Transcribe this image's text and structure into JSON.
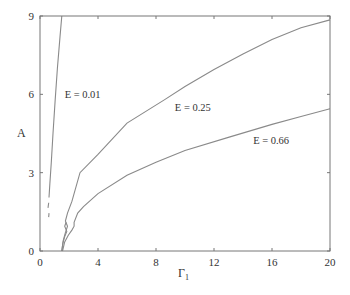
{
  "chart_data": {
    "type": "line",
    "title": "",
    "xlabel": "Γ",
    "xlabel_sub": "1",
    "ylabel": "A",
    "xlim": [
      0,
      20
    ],
    "ylim": [
      0,
      9
    ],
    "xticks": [
      0,
      4,
      8,
      12,
      16,
      20
    ],
    "yticks": [
      0,
      3,
      6,
      9
    ],
    "grid": false,
    "legend": "inline labels",
    "line_color": "#8a8a8a",
    "series": [
      {
        "name": "E = 0.01",
        "label_pos": {
          "x": 1.7,
          "y": 6.0
        },
        "segments": [
          [
            [
              0.62,
              2.05
            ],
            [
              0.68,
              2.6
            ],
            [
              0.78,
              3.4
            ],
            [
              0.9,
              4.5
            ],
            [
              1.05,
              5.8
            ],
            [
              1.2,
              7.0
            ],
            [
              1.38,
              8.2
            ],
            [
              1.5,
              9.0
            ]
          ],
          [
            [
              0.55,
              1.65
            ],
            [
              0.6,
              1.85
            ]
          ],
          [
            [
              0.6,
              1.3
            ],
            [
              0.62,
              1.45
            ]
          ]
        ]
      },
      {
        "name": "E = 0.25",
        "label_pos": {
          "x": 9.3,
          "y": 5.5
        },
        "points": [
          [
            1.5,
            0.0
          ],
          [
            1.6,
            0.4
          ],
          [
            1.75,
            0.7
          ],
          [
            1.9,
            0.95
          ],
          [
            1.75,
            1.15
          ],
          [
            1.9,
            1.45
          ],
          [
            2.2,
            1.9
          ],
          [
            2.76,
            3.0
          ],
          [
            4.0,
            3.7
          ],
          [
            6.0,
            4.9
          ],
          [
            8.6,
            5.8
          ],
          [
            10.0,
            6.3
          ],
          [
            12.0,
            6.95
          ],
          [
            14.0,
            7.55
          ],
          [
            16.0,
            8.1
          ],
          [
            18.0,
            8.55
          ],
          [
            20.0,
            8.85
          ]
        ]
      },
      {
        "name": "E = 0.66",
        "label_pos": {
          "x": 14.7,
          "y": 4.25
        },
        "points": [
          [
            1.55,
            0.0
          ],
          [
            1.7,
            0.35
          ],
          [
            1.95,
            0.6
          ],
          [
            2.2,
            0.8
          ],
          [
            2.35,
            0.95
          ],
          [
            2.35,
            1.1
          ],
          [
            2.6,
            1.45
          ],
          [
            3.0,
            1.7
          ],
          [
            4.0,
            2.2
          ],
          [
            6.0,
            2.9
          ],
          [
            8.0,
            3.4
          ],
          [
            10.0,
            3.85
          ],
          [
            13.1,
            4.37
          ],
          [
            16.0,
            4.85
          ],
          [
            18.0,
            5.15
          ],
          [
            20.0,
            5.45
          ]
        ]
      },
      {
        "name": "E = 0.01 lower branch",
        "points": [
          [
            1.5,
            0.0
          ],
          [
            1.58,
            0.3
          ],
          [
            1.7,
            0.55
          ],
          [
            1.85,
            0.75
          ],
          [
            1.7,
            0.95
          ],
          [
            1.8,
            1.1
          ]
        ]
      }
    ]
  },
  "axes": {
    "y_label": "A",
    "x_label": "Γ",
    "x_label_sub": "1"
  }
}
